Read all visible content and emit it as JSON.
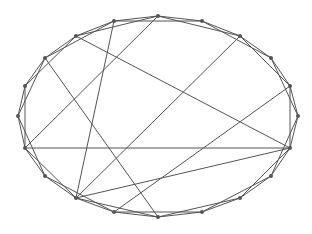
{
  "diagram": {
    "type": "graph",
    "style": {
      "edge_color": "#555555",
      "node_color": "#555555",
      "background": "#ffffff"
    },
    "nodes": [
      {
        "id": 0,
        "x": 158,
        "y": 16
      },
      {
        "id": 1,
        "x": 202,
        "y": 21
      },
      {
        "id": 2,
        "x": 240,
        "y": 36
      },
      {
        "id": 3,
        "x": 271,
        "y": 58
      },
      {
        "id": 4,
        "x": 290,
        "y": 86
      },
      {
        "id": 5,
        "x": 298,
        "y": 116
      },
      {
        "id": 6,
        "x": 290,
        "y": 148
      },
      {
        "id": 7,
        "x": 271,
        "y": 176
      },
      {
        "id": 8,
        "x": 240,
        "y": 198
      },
      {
        "id": 9,
        "x": 202,
        "y": 212
      },
      {
        "id": 10,
        "x": 158,
        "y": 217
      },
      {
        "id": 11,
        "x": 114,
        "y": 212
      },
      {
        "id": 12,
        "x": 76,
        "y": 198
      },
      {
        "id": 13,
        "x": 45,
        "y": 176
      },
      {
        "id": 14,
        "x": 25,
        "y": 148
      },
      {
        "id": 15,
        "x": 18,
        "y": 116
      },
      {
        "id": 16,
        "x": 25,
        "y": 86
      },
      {
        "id": 17,
        "x": 45,
        "y": 58
      },
      {
        "id": 18,
        "x": 76,
        "y": 36
      },
      {
        "id": 19,
        "x": 114,
        "y": 21
      }
    ],
    "edges": [
      [
        0,
        1
      ],
      [
        1,
        2
      ],
      [
        2,
        3
      ],
      [
        3,
        4
      ],
      [
        4,
        5
      ],
      [
        5,
        6
      ],
      [
        6,
        7
      ],
      [
        7,
        8
      ],
      [
        8,
        9
      ],
      [
        9,
        10
      ],
      [
        10,
        11
      ],
      [
        11,
        12
      ],
      [
        12,
        13
      ],
      [
        13,
        14
      ],
      [
        14,
        15
      ],
      [
        15,
        16
      ],
      [
        16,
        17
      ],
      [
        17,
        18
      ],
      [
        18,
        19
      ],
      [
        19,
        0
      ],
      [
        0,
        2
      ],
      [
        1,
        3
      ],
      [
        2,
        4
      ],
      [
        3,
        5
      ],
      [
        4,
        6
      ],
      [
        5,
        7
      ],
      [
        6,
        8
      ],
      [
        7,
        9
      ],
      [
        8,
        10
      ],
      [
        9,
        11
      ],
      [
        10,
        12
      ],
      [
        11,
        13
      ],
      [
        12,
        14
      ],
      [
        13,
        15
      ],
      [
        14,
        16
      ],
      [
        15,
        17
      ],
      [
        16,
        18
      ],
      [
        17,
        19
      ],
      [
        18,
        0
      ],
      [
        19,
        1
      ],
      [
        18,
        6
      ],
      [
        2,
        12
      ],
      [
        4,
        11
      ],
      [
        6,
        12
      ],
      [
        17,
        10
      ],
      [
        19,
        12
      ],
      [
        0,
        14
      ],
      [
        14,
        6
      ]
    ],
    "caption": ""
  }
}
